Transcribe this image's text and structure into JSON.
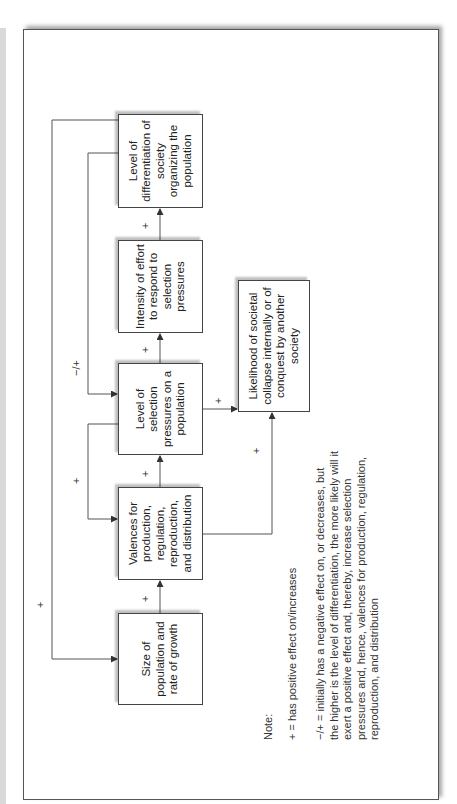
{
  "diagram": {
    "boxes": {
      "size": "Size of population and rate of growth",
      "valences": "Valences for production, regulation, reproduction, and distribution",
      "selection": "Level of selection pressures on a population",
      "intensity": "Intensity of effort to respond to selection pressures",
      "differentiation": "Level of differentiation of society organizing the population",
      "collapse": "Likelihood of societal collapse internally or of conquest by another society"
    },
    "edge_labels": {
      "size_to_valences": "+",
      "valences_to_selection": "+",
      "selection_to_intensity": "+",
      "intensity_to_differentiation": "+",
      "selection_to_collapse": "+",
      "valences_to_collapse": "+",
      "differentiation_to_selection": "−/+",
      "selection_to_valences": "+",
      "differentiation_to_size": "+"
    },
    "note": {
      "title": "Note:",
      "plus": "+ = has positive effect on/increases",
      "minus_plus": "−/+ = initially has a negative effect on, or decreases, but the higher is the level of differentiation, the more likely will it exert a positive effect and, thereby, increase selection pressures and, hence, valences for production, regulation, reproduction, and distribution"
    },
    "colors": {
      "line": "#444444",
      "box_border": "#444444",
      "text": "#222222"
    }
  }
}
